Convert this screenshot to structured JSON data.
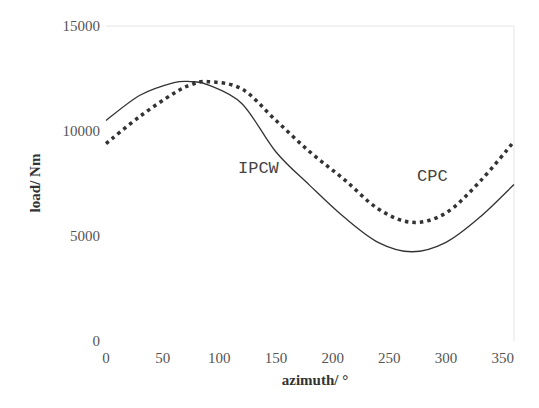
{
  "chart_data": {
    "type": "line",
    "title": "",
    "xlabel": "azimuth/ °",
    "ylabel": "load/ Nm",
    "xlim": [
      0,
      360
    ],
    "ylim": [
      0,
      15000
    ],
    "x_ticks": [
      "0",
      "50",
      "100",
      "150",
      "200",
      "250",
      "300",
      "350"
    ],
    "y_ticks": [
      "0",
      "5000",
      "10000",
      "15000"
    ],
    "grid": false,
    "legend": "inline labels",
    "x": [
      0,
      30,
      60,
      75,
      90,
      120,
      150,
      180,
      210,
      240,
      270,
      300,
      330,
      360
    ],
    "series": [
      {
        "name": "IPCW",
        "style": "solid",
        "color": "#333333",
        "values": [
          10500,
          11700,
          12300,
          12350,
          12200,
          11300,
          9000,
          7400,
          5900,
          4700,
          4250,
          4700,
          5900,
          7450
        ]
      },
      {
        "name": "CPC",
        "style": "dotted",
        "color": "#333333",
        "values": [
          9400,
          10700,
          11800,
          12200,
          12350,
          12000,
          10500,
          9000,
          7700,
          6300,
          5650,
          6100,
          7600,
          9500
        ]
      }
    ],
    "annotations": [
      {
        "text": "IPCW",
        "x": 145,
        "y": 9300
      },
      {
        "text": "CPC",
        "x": 297,
        "y": 8800
      }
    ]
  },
  "labels": {
    "xlabel": "azimuth/ °",
    "ylabel": "load/ Nm",
    "ipcw": "IPCW",
    "cpc": "CPC"
  }
}
